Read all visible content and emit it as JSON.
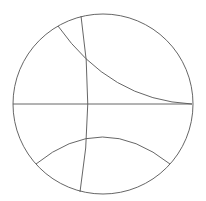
{
  "diagram": {
    "type": "poincare-disk",
    "stroke_color": "#555555",
    "background": "#ffffff",
    "disk": {
      "cx": 103,
      "cy": 104,
      "r": 90
    },
    "geodesics": [
      {
        "name": "horizontal-diameter",
        "d": "M13,104 L192,104"
      },
      {
        "name": "upper-arc",
        "d": "M58,26 Q110,100 192,104"
      },
      {
        "name": "near-vertical-arc",
        "d": "M81,16 Q95,104 80,192"
      },
      {
        "name": "lower-arc",
        "d": "M36,164 Q102,110 170,164"
      }
    ]
  }
}
